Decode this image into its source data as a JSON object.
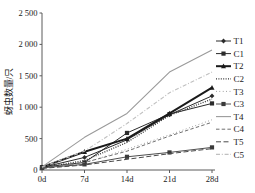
{
  "chart_data": {
    "type": "line",
    "title": "",
    "xlabel": "",
    "ylabel": "蚜虫数量/只",
    "x": [
      "0d",
      "7d",
      "14d",
      "21d",
      "28d"
    ],
    "xlim": [
      0,
      4
    ],
    "ylim": [
      0,
      2500
    ],
    "yticks": [
      0,
      500,
      1000,
      1500,
      2000,
      2500
    ],
    "ytick_labels": [
      "0",
      "500",
      "1 000",
      "1 500",
      "2 000",
      "2 500"
    ],
    "grid": false,
    "legend_position": "right",
    "series": [
      {
        "name": "T1",
        "values": [
          40,
          200,
          480,
          880,
          1180
        ],
        "color": "#2b2b2b",
        "style": "solid",
        "width": 1.0,
        "marker": "diamond"
      },
      {
        "name": "C1",
        "values": [
          45,
          120,
          590,
          890,
          1060
        ],
        "color": "#2b2b2b",
        "style": "solid",
        "width": 1.0,
        "marker": "square"
      },
      {
        "name": "T2",
        "values": [
          45,
          290,
          500,
          900,
          1310
        ],
        "color": "#1a1a1a",
        "style": "solid",
        "width": 2.0,
        "marker": "triangle"
      },
      {
        "name": "C2",
        "values": [
          35,
          150,
          440,
          870,
          1130
        ],
        "color": "#333333",
        "style": "dotted",
        "width": 1.3,
        "marker": "none"
      },
      {
        "name": "T3",
        "values": [
          30,
          110,
          330,
          560,
          800
        ],
        "color": "#8a8a8a",
        "style": "dotted-sparse",
        "width": 1.0,
        "marker": "none"
      },
      {
        "name": "C3",
        "values": [
          35,
          90,
          210,
          280,
          360
        ],
        "color": "#3a3a3a",
        "style": "solid",
        "width": 0.9,
        "marker": "square"
      },
      {
        "name": "T4",
        "values": [
          50,
          520,
          900,
          1560,
          1910
        ],
        "color": "#9a9a9a",
        "style": "solid",
        "width": 1.1,
        "marker": "none"
      },
      {
        "name": "C4",
        "values": [
          30,
          120,
          300,
          540,
          760
        ],
        "color": "#6f6f6f",
        "style": "dashed",
        "width": 1.0,
        "marker": "none"
      },
      {
        "name": "T5",
        "values": [
          25,
          80,
          170,
          260,
          340
        ],
        "color": "#4a4a4a",
        "style": "dashed-long",
        "width": 1.0,
        "marker": "none"
      },
      {
        "name": "C5",
        "values": [
          45,
          300,
          740,
          1230,
          1560
        ],
        "color": "#c0c0c0",
        "style": "dash-dot",
        "width": 1.1,
        "marker": "none"
      }
    ]
  }
}
